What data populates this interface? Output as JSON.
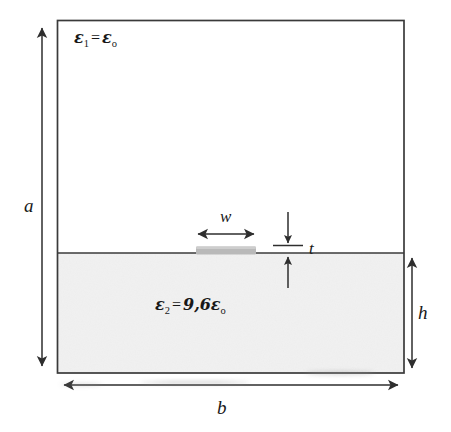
{
  "figure": {
    "type": "cross-section-diagram",
    "regions": [
      {
        "name": "upper-region-air",
        "permittivity_label": "ε1 = εo",
        "symbol": "ε",
        "subscript": "1",
        "value_text": "ε",
        "value_subscript": "o",
        "fill": "#ffffff"
      },
      {
        "name": "lower-region-substrate",
        "permittivity_label": "ε2 = 9,6εo",
        "symbol": "ε",
        "subscript": "2",
        "value_text": "9,6ε",
        "value_subscript": "o",
        "relative_permittivity": "9,6",
        "fill": "#f1f1f1"
      }
    ],
    "conductor": {
      "name": "strip-conductor",
      "fill": "#b9b9b9"
    },
    "dimensions": [
      {
        "key": "a",
        "label": "a",
        "description": "enclosure height",
        "orientation": "vertical",
        "position": "left"
      },
      {
        "key": "b",
        "label": "b",
        "description": "enclosure width",
        "orientation": "horizontal",
        "position": "bottom"
      },
      {
        "key": "h",
        "label": "h",
        "description": "substrate height",
        "orientation": "vertical",
        "position": "right"
      },
      {
        "key": "w",
        "label": "w",
        "description": "strip width",
        "orientation": "horizontal",
        "position": "above-strip"
      },
      {
        "key": "t",
        "label": "t",
        "description": "strip thickness",
        "orientation": "vertical",
        "position": "right-of-strip"
      }
    ],
    "colors": {
      "outline": "#3a3a3a",
      "substrate_fill": "#f1f1f1",
      "air_fill": "#ffffff",
      "conductor_fill": "#b9b9b9",
      "text": "#181818"
    }
  }
}
